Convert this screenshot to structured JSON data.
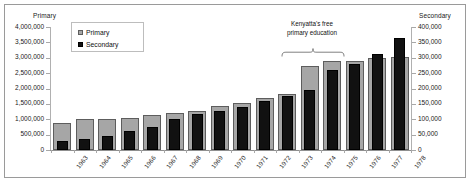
{
  "chart_data": {
    "type": "bar",
    "title": "",
    "subtitle": "",
    "xlabel": "",
    "ylabel": "Primary",
    "y2label": "Secondary",
    "grid": false,
    "legend_position": "top-left-inside",
    "categories": [
      "1963",
      "1964",
      "1965",
      "1966",
      "1967",
      "1968",
      "1969",
      "1970",
      "1971",
      "1972",
      "1973",
      "1974",
      "1975",
      "1976",
      "1977",
      "1978"
    ],
    "ylim": [
      0,
      4000000
    ],
    "y2lim": [
      0,
      400000
    ],
    "ytick_labels": [
      "4,000,000",
      "3,500,000",
      "3,000,000",
      "2,500,000",
      "2,000,000",
      "1,500,000",
      "1,000,000",
      "500,000",
      "0"
    ],
    "ytick_values": [
      4000000,
      3500000,
      3000000,
      2500000,
      2000000,
      1500000,
      1000000,
      500000,
      0
    ],
    "y2tick_labels": [
      "400,000",
      "350,000",
      "300,000",
      "250,000",
      "200,000",
      "150,000",
      "100,000",
      "50,000",
      "0"
    ],
    "y2tick_values": [
      400000,
      350000,
      300000,
      250000,
      200000,
      150000,
      100000,
      50000,
      0
    ],
    "series": [
      {
        "name": "Primary",
        "axis": "left",
        "color": "#a6a6a6",
        "values": [
          890000,
          1010000,
          1010000,
          1040000,
          1130000,
          1210000,
          1280000,
          1430000,
          1530000,
          1680000,
          1820000,
          2730000,
          2880000,
          2890000,
          3000000,
          3030000
        ]
      },
      {
        "name": "Secondary",
        "axis": "right",
        "color": "#111111",
        "values": [
          30000,
          35000,
          47000,
          63000,
          75000,
          101000,
          116000,
          126000,
          139000,
          161000,
          175000,
          195000,
          261000,
          281000,
          311000,
          363000
        ]
      }
    ],
    "annotations": [
      {
        "name": "free-primary-education",
        "text": "Kenyatta's free\nprimary education",
        "span_categories": [
          "1973",
          "1975"
        ],
        "marker": "curly-brace"
      }
    ]
  },
  "legend": {
    "items": [
      {
        "label": "Primary",
        "color": "#a6a6a6"
      },
      {
        "label": "Secondary",
        "color": "#111111"
      }
    ]
  },
  "axes": {
    "primary_title": "Primary",
    "secondary_title": "Secondary"
  },
  "caption": {
    "text": ""
  }
}
